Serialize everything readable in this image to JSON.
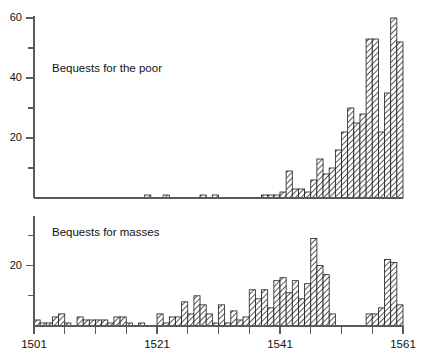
{
  "figure": {
    "background_color": "#ffffff",
    "bar_outline_color": "#1c1c1c",
    "bar_hatch_color": "#3a3a3a",
    "axis_color": "#555c5e"
  },
  "panels": {
    "top": {
      "label": "Bequests for the poor",
      "y_ticks_major": [
        "20",
        "40",
        "60"
      ],
      "y_minor_values": [
        10,
        30,
        50
      ],
      "y_max": 60
    },
    "bottom": {
      "label": "Bequests for masses",
      "y_ticks_major": [
        "20"
      ],
      "y_minor_values": [
        10,
        30
      ],
      "y_max": 30
    }
  },
  "x_axis": {
    "tick_labels": [
      "1501",
      "1521",
      "1541",
      "1561"
    ],
    "labeled_years": [
      1501,
      1521,
      1541,
      1561
    ],
    "tick_years": [
      1501,
      1506,
      1511,
      1516,
      1521,
      1526,
      1531,
      1536,
      1541,
      1546,
      1551,
      1556,
      1561
    ],
    "min": 1501,
    "max": 1561
  },
  "chart_data": {
    "type": "bar",
    "title": "",
    "xlabel": "",
    "ylabel": "",
    "grid": false,
    "legend_position": "none",
    "x": [
      1501,
      1502,
      1503,
      1504,
      1505,
      1506,
      1507,
      1508,
      1509,
      1510,
      1511,
      1512,
      1513,
      1514,
      1515,
      1516,
      1517,
      1518,
      1519,
      1520,
      1521,
      1522,
      1523,
      1524,
      1525,
      1526,
      1527,
      1528,
      1529,
      1530,
      1531,
      1532,
      1533,
      1534,
      1535,
      1536,
      1537,
      1538,
      1539,
      1540,
      1541,
      1542,
      1543,
      1544,
      1545,
      1546,
      1547,
      1548,
      1549,
      1550,
      1551,
      1552,
      1553,
      1554,
      1555,
      1556,
      1557,
      1558,
      1559,
      1560
    ],
    "series": [
      {
        "name": "Bequests for the poor",
        "panel": "top",
        "ylim": [
          0,
          62
        ],
        "values": [
          0,
          0,
          0,
          0,
          0,
          0,
          0,
          0,
          0,
          0,
          0,
          0,
          0,
          0,
          0,
          0,
          0,
          0,
          1,
          0,
          0,
          1,
          0,
          0,
          0,
          0,
          0,
          1,
          0,
          1,
          0,
          0,
          0,
          0,
          0,
          0,
          0,
          1,
          1,
          1,
          2,
          9,
          3,
          3,
          2,
          6,
          13,
          8,
          10,
          16,
          22,
          30,
          25,
          28,
          53,
          53,
          22,
          35,
          60,
          52
        ]
      },
      {
        "name": "Bequests for masses",
        "panel": "bottom",
        "ylim": [
          0,
          32
        ],
        "values": [
          2,
          1,
          1,
          3,
          4,
          1,
          0,
          3,
          2,
          2,
          2,
          2,
          1,
          3,
          3,
          1,
          0,
          1,
          0,
          0,
          4,
          1,
          3,
          3,
          8,
          4,
          10,
          7,
          4,
          1,
          7,
          1,
          5,
          2,
          3,
          12,
          9,
          12,
          6,
          15,
          16,
          11,
          15,
          9,
          14,
          29,
          20,
          17,
          4,
          0,
          0,
          0,
          0,
          0,
          4,
          4,
          6,
          22,
          21,
          7
        ]
      }
    ],
    "annotations": [
      {
        "text": "Bequests for the poor",
        "panel": "top"
      },
      {
        "text": "Bequests for masses",
        "panel": "bottom"
      }
    ]
  }
}
